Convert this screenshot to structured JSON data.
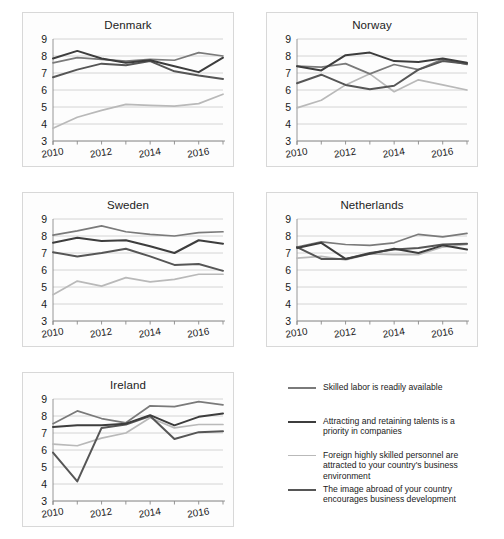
{
  "figure": {
    "panels": [
      "Denmark",
      "Norway",
      "Sweden",
      "Netherlands",
      "Ireland"
    ],
    "background": "#ffffff",
    "panel_border": "#d8d8d8"
  },
  "legend": {
    "position": "bottom-right",
    "entries": [
      {
        "label": "Skilled labor is readily available",
        "color": "#7a7a7a",
        "swatch": "line-swatch"
      },
      {
        "label": "Attracting and retaining talents is a priority in companies",
        "color": "#3d3d3d",
        "swatch": "line-swatch"
      },
      {
        "label": "Foreign highly skilled personnel are attracted to your country's business environment",
        "color": "#b9b9b9",
        "swatch": "line-swatch"
      },
      {
        "label": "The image abroad of your country encourages business development",
        "color": "#565656",
        "swatch": "line-swatch"
      }
    ]
  },
  "chart_data": [
    {
      "type": "line",
      "title": "Denmark",
      "xlabel": "",
      "ylabel": "",
      "x": [
        2010,
        2011,
        2012,
        2013,
        2014,
        2015,
        2016,
        2017
      ],
      "xticks": [
        2010,
        2012,
        2014,
        2016
      ],
      "ylim": [
        3,
        9
      ],
      "yticks": [
        3,
        4,
        5,
        6,
        7,
        8,
        9
      ],
      "grid": true,
      "series": [
        {
          "name": "Skilled labor is readily available",
          "color": "#7a7a7a",
          "values": [
            7.6,
            7.9,
            7.8,
            7.7,
            7.8,
            7.75,
            8.2,
            8.0
          ]
        },
        {
          "name": "Attracting and retaining talents is a priority in companies",
          "color": "#3d3d3d",
          "values": [
            7.85,
            8.3,
            7.85,
            7.6,
            7.75,
            7.4,
            7.05,
            7.9
          ]
        },
        {
          "name": "Foreign highly skilled personnel are attracted to your country's business environment",
          "color": "#b9b9b9",
          "values": [
            3.75,
            4.4,
            4.8,
            5.15,
            5.1,
            5.05,
            5.2,
            5.75
          ]
        },
        {
          "name": "The image abroad of your country encourages business development",
          "color": "#565656",
          "values": [
            6.75,
            7.2,
            7.55,
            7.45,
            7.7,
            7.1,
            6.85,
            6.65
          ]
        }
      ]
    },
    {
      "type": "line",
      "title": "Norway",
      "xlabel": "",
      "ylabel": "",
      "x": [
        2010,
        2011,
        2012,
        2013,
        2014,
        2015,
        2016,
        2017
      ],
      "xticks": [
        2010,
        2012,
        2014,
        2016
      ],
      "ylim": [
        3,
        9
      ],
      "yticks": [
        3,
        4,
        5,
        6,
        7,
        8,
        9
      ],
      "grid": true,
      "series": [
        {
          "name": "Skilled labor is readily available",
          "color": "#7a7a7a",
          "values": [
            7.4,
            7.35,
            7.55,
            6.95,
            7.5,
            7.2,
            7.8,
            7.5
          ]
        },
        {
          "name": "Attracting and retaining talents is a priority in companies",
          "color": "#3d3d3d",
          "values": [
            7.4,
            7.15,
            8.05,
            8.2,
            7.7,
            7.65,
            7.85,
            7.6
          ]
        },
        {
          "name": "Foreign highly skilled personnel are attracted to your country's business environment",
          "color": "#b9b9b9",
          "values": [
            4.95,
            5.4,
            6.3,
            6.95,
            5.9,
            6.6,
            6.3,
            6.0
          ]
        },
        {
          "name": "The image abroad of your country encourages business development",
          "color": "#565656",
          "values": [
            6.4,
            6.9,
            6.3,
            6.05,
            6.25,
            7.2,
            7.7,
            7.55
          ]
        }
      ]
    },
    {
      "type": "line",
      "title": "Sweden",
      "xlabel": "",
      "ylabel": "",
      "x": [
        2010,
        2011,
        2012,
        2013,
        2014,
        2015,
        2016,
        2017
      ],
      "xticks": [
        2010,
        2012,
        2014,
        2016
      ],
      "ylim": [
        3,
        9
      ],
      "yticks": [
        3,
        4,
        5,
        6,
        7,
        8,
        9
      ],
      "grid": true,
      "series": [
        {
          "name": "Skilled labor is readily available",
          "color": "#7a7a7a",
          "values": [
            8.05,
            8.3,
            8.6,
            8.25,
            8.1,
            8.0,
            8.2,
            8.25
          ]
        },
        {
          "name": "Attracting and retaining talents is a priority in companies",
          "color": "#3d3d3d",
          "values": [
            7.6,
            7.9,
            7.7,
            7.75,
            7.4,
            7.0,
            7.75,
            7.55
          ]
        },
        {
          "name": "Foreign highly skilled personnel are attracted to your country's business environment",
          "color": "#b9b9b9",
          "values": [
            4.55,
            5.35,
            5.05,
            5.55,
            5.3,
            5.45,
            5.75,
            5.75
          ]
        },
        {
          "name": "The image abroad of your country encourages business development",
          "color": "#565656",
          "values": [
            7.05,
            6.8,
            7.0,
            7.25,
            6.8,
            6.3,
            6.35,
            5.95
          ]
        }
      ]
    },
    {
      "type": "line",
      "title": "Netherlands",
      "xlabel": "",
      "ylabel": "",
      "x": [
        2010,
        2011,
        2012,
        2013,
        2014,
        2015,
        2016,
        2017
      ],
      "xticks": [
        2010,
        2012,
        2014,
        2016
      ],
      "ylim": [
        3,
        9
      ],
      "yticks": [
        3,
        4,
        5,
        6,
        7,
        8,
        9
      ],
      "grid": true,
      "series": [
        {
          "name": "Skilled labor is readily available",
          "color": "#7a7a7a",
          "values": [
            7.35,
            7.65,
            7.5,
            7.45,
            7.6,
            8.1,
            7.95,
            8.15
          ]
        },
        {
          "name": "Attracting and retaining talents is a priority in companies",
          "color": "#3d3d3d",
          "values": [
            7.3,
            7.6,
            6.65,
            6.95,
            7.25,
            7.0,
            7.45,
            7.2
          ]
        },
        {
          "name": "Foreign highly skilled personnel are attracted to your country's business environment",
          "color": "#b9b9b9",
          "values": [
            6.7,
            6.8,
            6.6,
            6.95,
            6.9,
            6.9,
            7.35,
            7.5
          ]
        },
        {
          "name": "The image abroad of your country encourages business development",
          "color": "#565656",
          "values": [
            7.35,
            6.65,
            6.65,
            7.0,
            7.2,
            7.3,
            7.5,
            7.55
          ]
        }
      ]
    },
    {
      "type": "line",
      "title": "Ireland",
      "xlabel": "",
      "ylabel": "",
      "x": [
        2010,
        2011,
        2012,
        2013,
        2014,
        2015,
        2016,
        2017
      ],
      "xticks": [
        2010,
        2012,
        2014,
        2016
      ],
      "ylim": [
        3,
        9
      ],
      "yticks": [
        3,
        4,
        5,
        6,
        7,
        8,
        9
      ],
      "grid": true,
      "series": [
        {
          "name": "Skilled labor is readily available",
          "color": "#7a7a7a",
          "values": [
            7.55,
            8.3,
            7.85,
            7.6,
            8.6,
            8.55,
            8.85,
            8.65
          ]
        },
        {
          "name": "Attracting and retaining talents is a priority in companies",
          "color": "#3d3d3d",
          "values": [
            7.35,
            7.45,
            7.45,
            7.55,
            8.05,
            7.45,
            7.95,
            8.15
          ]
        },
        {
          "name": "Foreign highly skilled personnel are attracted to your country's business environment",
          "color": "#b9b9b9",
          "values": [
            6.35,
            6.25,
            6.7,
            7.0,
            7.9,
            7.3,
            7.5,
            7.5
          ]
        },
        {
          "name": "The image abroad of your country encourages business development",
          "color": "#565656",
          "values": [
            5.85,
            4.15,
            7.3,
            7.5,
            8.0,
            6.65,
            7.05,
            7.1
          ]
        }
      ]
    }
  ]
}
